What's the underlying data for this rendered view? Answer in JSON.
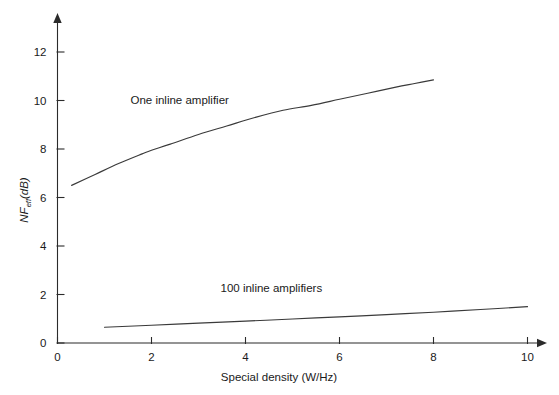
{
  "chart_data": {
    "type": "line",
    "title": "",
    "xlabel": "Special density (W/Hz)",
    "ylabel": "NF_eff (dB)",
    "ylabel_main": "NF",
    "ylabel_sub": "eff",
    "ylabel_unit": "(dB)",
    "xlim": [
      0,
      10.6
    ],
    "ylim": [
      0,
      13.2
    ],
    "xticks": [
      0,
      2,
      4,
      6,
      8,
      10
    ],
    "xtick_labels": [
      "0",
      "2",
      "4",
      "6",
      "8",
      "10"
    ],
    "yticks": [
      0,
      2,
      4,
      6,
      8,
      10,
      12
    ],
    "ytick_labels": [
      "0",
      "2",
      "4",
      "6",
      "8",
      "10",
      "12"
    ],
    "grid": false,
    "legend_position": "inline-annotation",
    "axis_style": "arrow-tipped-l-axes",
    "series": [
      {
        "name": "One inline amplifier",
        "label_x": 2.6,
        "label_y": 9.85,
        "x": [
          0.3,
          0.8,
          1.3,
          1.8,
          2.0,
          2.4,
          3.0,
          3.6,
          4.2,
          4.8,
          5.4,
          6.0,
          6.6,
          7.2,
          7.6,
          8.0
        ],
        "values": [
          6.5,
          6.95,
          7.4,
          7.8,
          7.95,
          8.2,
          8.6,
          8.95,
          9.3,
          9.6,
          9.8,
          10.05,
          10.3,
          10.55,
          10.7,
          10.85
        ]
      },
      {
        "name": "100 inline amplifiers",
        "label_x": 4.55,
        "label_y": 2.1,
        "x": [
          1.0,
          2.0,
          3.0,
          4.0,
          5.0,
          6.0,
          7.0,
          8.0,
          9.0,
          10.0
        ],
        "values": [
          0.65,
          0.73,
          0.82,
          0.9,
          0.99,
          1.08,
          1.17,
          1.27,
          1.38,
          1.5
        ]
      }
    ],
    "colors": {
      "axis": "#2b2b2b",
      "curve": "#3a3a3a",
      "text": "#1a1a1a",
      "background": "#ffffff"
    }
  }
}
